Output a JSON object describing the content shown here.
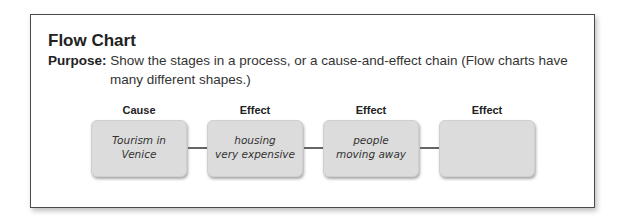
{
  "header": {
    "title": "Flow Chart",
    "purpose_label": "Purpose:",
    "purpose_line1": "Show the stages in a process, or a cause-and-effect chain  (Flow charts have",
    "purpose_line2": "many different shapes.)"
  },
  "flow": {
    "steps": [
      {
        "label": "Cause",
        "text": "Tourism in\nVenice"
      },
      {
        "label": "Effect",
        "text": "housing\nvery expensive"
      },
      {
        "label": "Effect",
        "text": "people\nmoving away"
      },
      {
        "label": "Effect",
        "text": ""
      }
    ],
    "arrow_icon": "right-arrow-icon",
    "colors": {
      "box_fill": "#dcdcdc",
      "arrow": "#666666",
      "frame": "#4a4a4a"
    }
  }
}
